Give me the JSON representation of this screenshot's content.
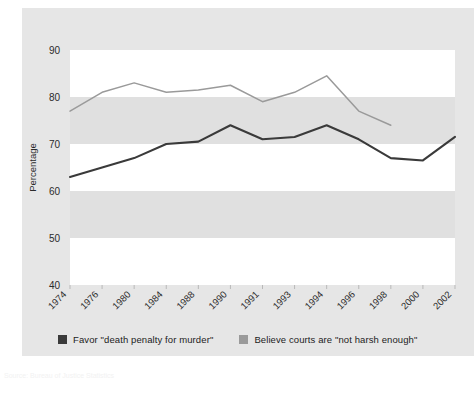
{
  "figure": {
    "ylabel": "Percentage",
    "card_bg": "#e6e6e6",
    "band_light": "#ffffff",
    "band_dark": "#e0e0e0",
    "source_note": "Source: Bureau of Justice Statistics"
  },
  "legend": {
    "position": "bottom",
    "items": [
      {
        "label": "Favor \"death penalty for murder\"",
        "color": "#3a3a3a"
      },
      {
        "label": "Believe courts are \"not harsh enough\"",
        "color": "#9a9a9a"
      }
    ]
  },
  "chart_data": {
    "type": "line",
    "title": "",
    "subtitle": "",
    "xlabel": "",
    "ylabel": "Percentage",
    "grid": true,
    "ylim": [
      40,
      90
    ],
    "yticks": [
      40,
      50,
      60,
      70,
      80,
      90
    ],
    "ytick_labels": [
      "40",
      "50",
      "60",
      "70",
      "80",
      "90"
    ],
    "x": [
      "1974",
      "1976",
      "1980",
      "1984",
      "1988",
      "1990",
      "1991",
      "1993",
      "1994",
      "1996",
      "1998",
      "2000",
      "2002"
    ],
    "categories": [
      "1974",
      "1976",
      "1980",
      "1984",
      "1988",
      "1990",
      "1991",
      "1993",
      "1994",
      "1996",
      "1998",
      "2000",
      "2002"
    ],
    "series": [
      {
        "name": "Favor \"death penalty for murder\"",
        "color": "#3a3a3a",
        "values": [
          63,
          65,
          67,
          70,
          70.5,
          74,
          71,
          71.5,
          74,
          71,
          67,
          66.5,
          71.5
        ]
      },
      {
        "name": "Believe courts are \"not harsh enough\"",
        "color": "#9a9a9a",
        "values": [
          77,
          81,
          83,
          81,
          81.5,
          82.5,
          79,
          81,
          84.5,
          77,
          74,
          null,
          null
        ]
      }
    ]
  }
}
